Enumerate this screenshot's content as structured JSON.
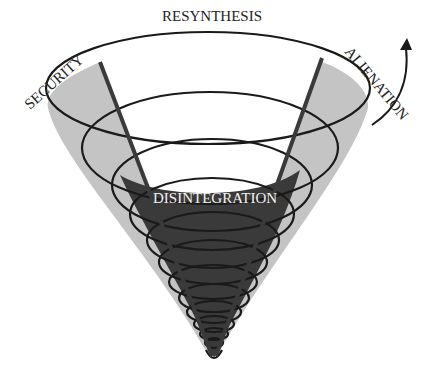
{
  "diagram": {
    "labels": {
      "top": "RESYNTHESIS",
      "left": "SECURITY",
      "right": "ALIENATION",
      "center": "DISINTEGRATION"
    },
    "colors": {
      "light_band": "#bdbdbd",
      "dark_core": "#3a3a3a",
      "stroke": "#1a1a1a"
    }
  }
}
